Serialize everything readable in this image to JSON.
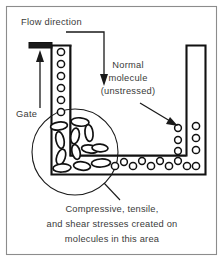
{
  "figure": {
    "border_color": "#8c8c8c",
    "line_color": "#111111",
    "text_color": "#3a3a3a",
    "background": "#ffffff"
  },
  "labels": {
    "flow_direction": "Flow direction",
    "gate": "Gate",
    "normal_molecule_line1": "Normal",
    "normal_molecule_line2": "molecule",
    "normal_molecule_line3": "(unstressed)"
  },
  "caption": {
    "line1": "Compressive, tensile,",
    "line2": "and shear stresses created on",
    "line3": "molecules in this area"
  },
  "icons": {
    "flow_arrow": "down-arrow-icon",
    "gate_arrow": "up-arrow-icon",
    "normal_molecule_pointer": "diagonal-arrow-icon",
    "callout": "circle-callout-icon"
  },
  "diagram_data": {
    "type": "technical-illustration",
    "cavity_shape": "L-shaped channel",
    "unstressed_molecules": {
      "shape": "circle",
      "description": "round molecules in straight channel sections"
    },
    "stressed_molecules": {
      "shape": "ellipse",
      "description": "elongated molecules at the corner bend"
    },
    "callout_region": {
      "center_x": 75,
      "center_y": 152,
      "radius": 43
    }
  }
}
